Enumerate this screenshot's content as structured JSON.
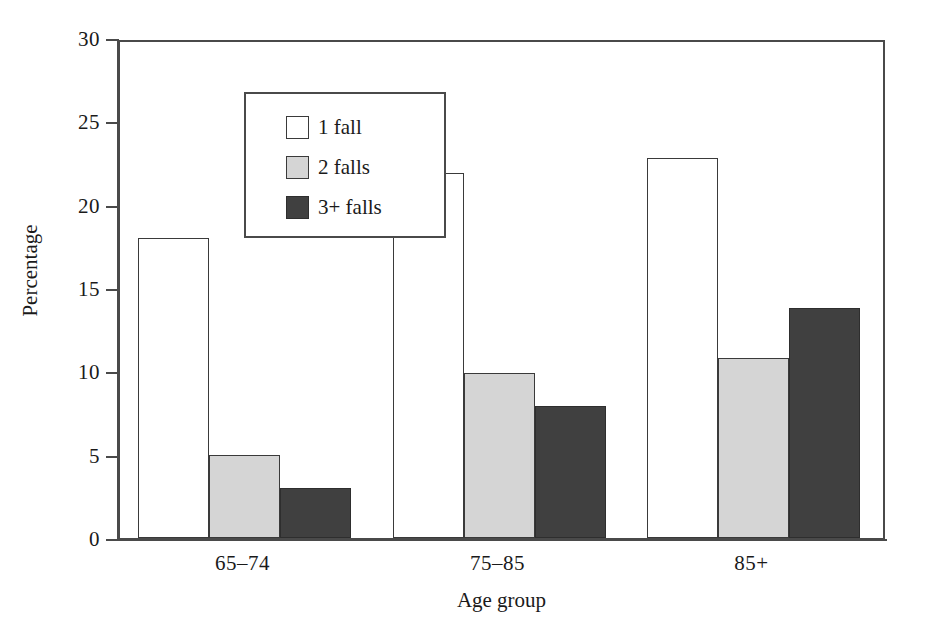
{
  "chart_data": {
    "type": "bar",
    "title": "",
    "xlabel": "Age group",
    "ylabel": "Percentage",
    "categories": [
      "65–74",
      "75–85",
      "85+"
    ],
    "series": [
      {
        "name": "1 fall",
        "values": [
          18.0,
          21.9,
          22.8
        ],
        "color": "#ffffff"
      },
      {
        "name": "2 falls",
        "values": [
          5.0,
          9.9,
          10.8
        ],
        "color": "#d5d5d5"
      },
      {
        "name": "3+ falls",
        "values": [
          3.0,
          7.9,
          13.8
        ],
        "color": "#404040"
      }
    ],
    "ylim": [
      0,
      30
    ],
    "yticks": [
      0,
      5,
      10,
      15,
      20,
      25,
      30
    ],
    "ytick_labels": [
      "0",
      "5",
      "10",
      "15",
      "20",
      "25",
      "30"
    ],
    "grid": false,
    "legend_position": "top-left",
    "axis_color": "#4a4a4a",
    "bar_edge_color": "#3a3a3a",
    "background": "#ffffff"
  },
  "legend": {
    "entries": [
      {
        "label": "1 fall"
      },
      {
        "label": "2 falls"
      },
      {
        "label": "3+ falls"
      }
    ]
  },
  "axes": {
    "y_title": "Percentage",
    "x_title": "Age group"
  }
}
